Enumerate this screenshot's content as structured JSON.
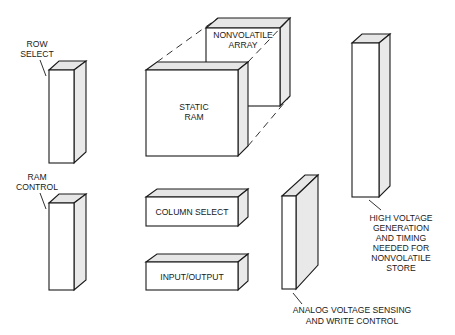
{
  "diagram": {
    "type": "block-diagram",
    "blocks": {
      "row_select": {
        "label_lines": [
          "ROW",
          "SELECT"
        ]
      },
      "ram_control": {
        "label_lines": [
          "RAM",
          "CONTROL"
        ]
      },
      "static_ram": {
        "label_lines": [
          "STATIC",
          "RAM"
        ]
      },
      "nonvolatile_array": {
        "label_lines": [
          "NONVOLATILE",
          "ARRAY"
        ]
      },
      "column_select": {
        "label": "COLUMN SELECT"
      },
      "input_output": {
        "label": "INPUT/OUTPUT"
      },
      "analog": {
        "label_lines": [
          "ANALOG VOLTAGE SENSING",
          "AND WRITE CONTROL"
        ]
      },
      "high_voltage": {
        "label_lines": [
          "HIGH VOLTAGE",
          "GENERATION",
          "AND TIMING",
          "NEEDED FOR",
          "NONVOLATILE",
          "STORE"
        ]
      }
    }
  }
}
